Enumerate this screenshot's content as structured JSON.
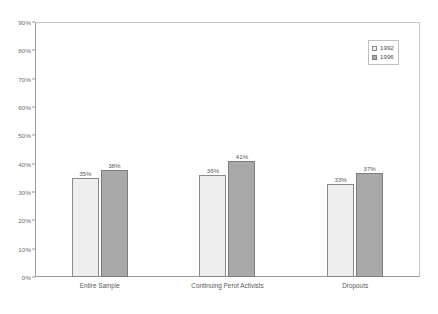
{
  "chart_data": {
    "type": "bar",
    "title": "",
    "subtitle": "",
    "xlabel": "",
    "ylabel": "",
    "ylim": [
      0,
      90
    ],
    "ytick_labels": [
      "0%",
      "10%",
      "20%",
      "30%",
      "40%",
      "50%",
      "60%",
      "70%",
      "80%",
      "90%"
    ],
    "ytick_values": [
      0,
      10,
      20,
      30,
      40,
      50,
      60,
      70,
      80,
      90
    ],
    "grid": false,
    "legend_position": "top-right",
    "categories": [
      "Entire Sample",
      "Continuing Perot Activists",
      "Dropouts"
    ],
    "series": [
      {
        "name": "1992",
        "color": "#eeeeee",
        "values": [
          35,
          36,
          33
        ],
        "data_labels": [
          "35%",
          "36%",
          "33%"
        ]
      },
      {
        "name": "1996",
        "color": "#a9a9a9",
        "values": [
          38,
          41,
          37
        ],
        "data_labels": [
          "38%",
          "41%",
          "37%"
        ]
      }
    ]
  },
  "legend": {
    "entries": [
      {
        "label": "1992",
        "swatch": "legend-swatch-1992"
      },
      {
        "label": "1996",
        "swatch": "legend-swatch-1996"
      }
    ]
  }
}
